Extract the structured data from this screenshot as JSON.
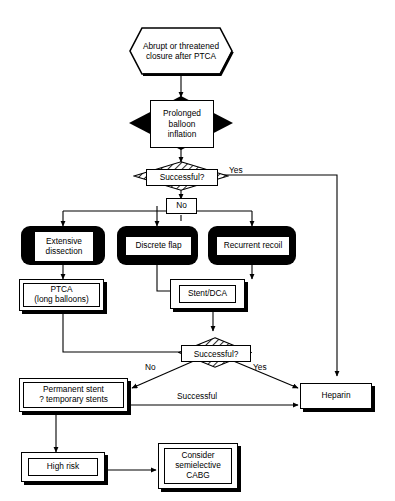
{
  "diagram": {
    "type": "flowchart",
    "nodes": {
      "start": {
        "label": "Abrupt or threatened closure after PTCA",
        "shape": "hexagon"
      },
      "prolonged": {
        "label": "Prolonged balloon inflation",
        "shape": "black-diamond"
      },
      "decision1": {
        "label": "Successful?",
        "shape": "hatched-diamond"
      },
      "no_badge": {
        "label": "No",
        "shape": "small-box"
      },
      "extensive": {
        "label": "Extensive dissection",
        "shape": "black-rounded"
      },
      "flap": {
        "label": "Discrete flap",
        "shape": "black-rounded"
      },
      "recoil": {
        "label": "Recurrent recoil",
        "shape": "black-rounded"
      },
      "ptca": {
        "label": "PTCA (long balloons)",
        "shape": "double-shadow-box"
      },
      "stent": {
        "label": "Stent/DCA",
        "shape": "double-shadow-box"
      },
      "decision2": {
        "label": "Successful?",
        "shape": "hatched-diamond"
      },
      "permanent": {
        "label": "Permanent stent ? temporary stents",
        "shape": "double-shadow-box"
      },
      "heparin": {
        "label": "Heparin",
        "shape": "shadow-box"
      },
      "highrisk": {
        "label": "High risk",
        "shape": "double-shadow-box"
      },
      "cabg": {
        "label": "Consider semielective CABG",
        "shape": "double-shadow-box"
      }
    },
    "node_lines": {
      "start_l1": "Abrupt or threatened",
      "start_l2": "closure after PTCA",
      "prolonged_l1": "Prolonged",
      "prolonged_l2": "balloon",
      "prolonged_l3": "inflation",
      "extensive_l1": "Extensive",
      "extensive_l2": "dissection",
      "ptca_l1": "PTCA",
      "ptca_l2": "(long balloons)",
      "permanent_l1": "Permanent stent",
      "permanent_l2": "? temporary stents",
      "cabg_l1": "Consider",
      "cabg_l2": "semielective",
      "cabg_l3": "CABG"
    },
    "edge_labels": {
      "yes1": "Yes",
      "no1": "No",
      "no2": "No",
      "yes2": "Yes",
      "successful": "Successful"
    },
    "colors": {
      "stroke": "#000000",
      "fill": "#ffffff",
      "solid": "#000000"
    }
  }
}
